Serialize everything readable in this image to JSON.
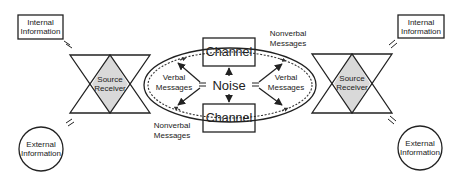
{
  "diagram": {
    "type": "communication-model",
    "left_node": {
      "internal_info": [
        "Internal",
        "Information"
      ],
      "external_info": [
        "External",
        "Information"
      ],
      "source_receiver": [
        "Source",
        "Receiver"
      ]
    },
    "right_node": {
      "internal_info": [
        "Internal",
        "Information"
      ],
      "external_info": [
        "External",
        "Information"
      ],
      "source_receiver": [
        "Source",
        "Receiver"
      ]
    },
    "center": {
      "channel_top": "Channel",
      "channel_bottom": "Channel",
      "noise": "Noise",
      "verbal_left": [
        "Verbal",
        "Messages"
      ],
      "verbal_right": [
        "Verbal",
        "Messages"
      ],
      "nonverbal_top_right": [
        "Nonverbal",
        "Messages"
      ],
      "nonverbal_bottom_left": [
        "Nonverbal",
        "Messages"
      ]
    },
    "colors": {
      "stroke": "#222222",
      "diamond_fill": "#d9d9d9",
      "background": "#ffffff"
    }
  }
}
